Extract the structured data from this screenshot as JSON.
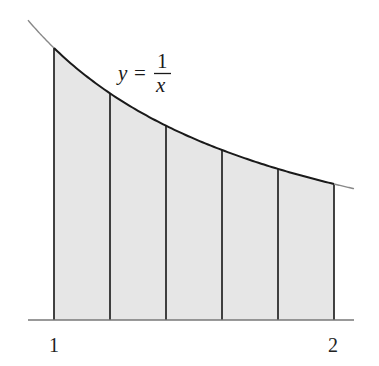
{
  "figure": {
    "function_label": {
      "lhs": "y",
      "equals": "=",
      "numerator": "1",
      "denominator": "x"
    },
    "x_tick_labels": [
      {
        "value": 1,
        "label": "1"
      },
      {
        "value": 2,
        "label": "2"
      }
    ],
    "colors": {
      "fill": "#e6e6e6",
      "curve": "#1a1a1a",
      "curve_extension": "#888888",
      "axis": "#777777",
      "partition_lines": "#222222"
    }
  },
  "chart_data": {
    "type": "area",
    "title": "",
    "function": "y = 1/x",
    "xlabel": "",
    "ylabel": "",
    "interval": [
      1,
      2
    ],
    "n_subintervals": 5,
    "partition_points": [
      1.0,
      1.2,
      1.4,
      1.6,
      1.8,
      2.0
    ],
    "function_values": [
      1.0,
      0.8333,
      0.7143,
      0.625,
      0.5556,
      0.5
    ],
    "shaded_region": "area under curve from x=1 to x=2",
    "x_tick_labels": [
      "1",
      "2"
    ],
    "grid": false,
    "legend": null
  }
}
